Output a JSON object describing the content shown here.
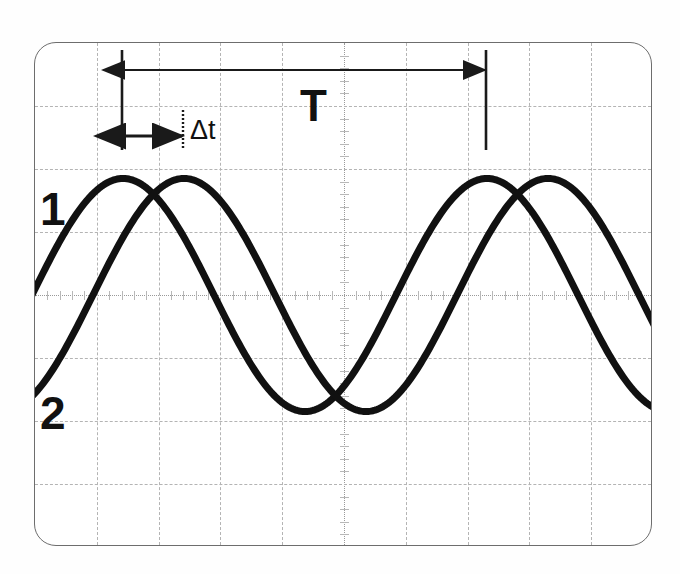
{
  "figure": {
    "kind": "oscilloscope-screen"
  },
  "screen": {
    "x": 34,
    "y": 42,
    "width": 618,
    "height": 504,
    "corner_radius": 22,
    "bezel_color": "#6d6d6d",
    "background": "#ffffff",
    "grid": {
      "divisions_x": 10,
      "divisions_y": 8,
      "div_px_x": 51.6,
      "div_px_y": 62.5,
      "grid_color": "#b4b4b4",
      "center_color": "#9a9a9a",
      "dashed": true,
      "center_dotted": true
    }
  },
  "annotations": {
    "period_label": "T",
    "delta_label": "Δt",
    "channel1_label": "1",
    "channel2_label": "2",
    "cursor_left_x": 122,
    "cursor_right_x": 486,
    "delta_right_x": 183,
    "period_arrow_y": 70,
    "delta_arrow_y": 136,
    "label_color": "#111111",
    "arrow_color": "#1a1a1a"
  },
  "chart_data": {
    "type": "line",
    "title": "",
    "xlabel": "",
    "ylabel": "",
    "grid": true,
    "legend_position": "inside-left",
    "xlim": [
      0,
      618
    ],
    "ylim": [
      -4,
      4
    ],
    "axis_units": {
      "x": "divisions (time)",
      "y": "divisions (amplitude)"
    },
    "measurements": {
      "period_T_px": 364,
      "period_T_div": 7.05,
      "delta_t_px": 61,
      "delta_t_div": 1.18,
      "phase_shift_deg": 60.3
    },
    "series": [
      {
        "name": "1",
        "label": "Channel 1",
        "color": "#111111",
        "stroke_width": 7,
        "amplitude_div": 1.85,
        "period_px": 364,
        "phase_px": 88,
        "offset_div": 0.0,
        "peaks_x": [
          88,
          452
        ],
        "troughs_x": [
          270,
          634
        ],
        "zero_crossings_x": [
          -3,
          179,
          361,
          543
        ]
      },
      {
        "name": "2",
        "label": "Channel 2",
        "color": "#111111",
        "stroke_width": 7,
        "amplitude_div": 1.85,
        "period_px": 364,
        "phase_px": 149,
        "offset_div": 0.0,
        "peaks_x": [
          149,
          513
        ],
        "troughs_x": [
          331,
          695
        ],
        "zero_crossings_x": [
          58,
          240,
          422,
          604
        ]
      }
    ]
  }
}
